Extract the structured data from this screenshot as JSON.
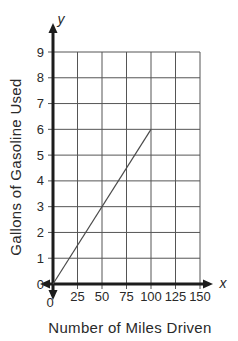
{
  "chart_data": {
    "type": "line",
    "title": "",
    "xlabel": "Number of Miles Driven",
    "ylabel": "Gallons of Gasoline Used",
    "x_axis_symbol": "x",
    "y_axis_symbol": "y",
    "x_ticks": [
      0,
      25,
      50,
      75,
      100,
      125,
      150
    ],
    "y_ticks": [
      0,
      1,
      2,
      3,
      4,
      5,
      6,
      7,
      8,
      9
    ],
    "xlim": [
      0,
      150
    ],
    "ylim": [
      0,
      9
    ],
    "grid": true,
    "legend": false,
    "series": [
      {
        "name": "gasoline-used-line",
        "points": [
          [
            0,
            0
          ],
          [
            100,
            6
          ]
        ]
      }
    ],
    "colors": {
      "background": "#ffffff",
      "axis": "#1c1c1c",
      "grid": "#555555",
      "line": "#4a4a4a",
      "text": "#2a2a2a"
    }
  }
}
